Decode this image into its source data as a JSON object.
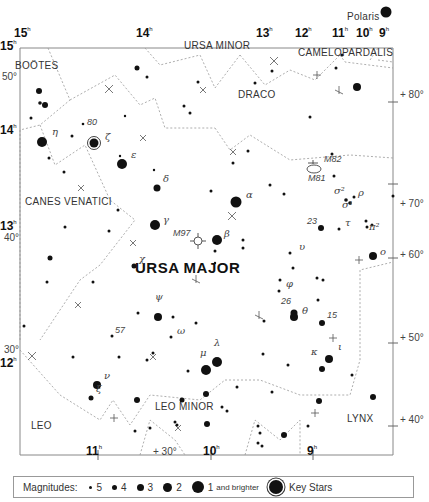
{
  "chart": {
    "title": "URSA MAJOR",
    "ra_labels": [
      {
        "text": "15",
        "sup": "h",
        "x": 14,
        "y": 37
      },
      {
        "text": "14",
        "sup": "h",
        "x": 136,
        "y": 37
      },
      {
        "text": "13",
        "sup": "h",
        "x": 256,
        "y": 37
      },
      {
        "text": "12",
        "sup": "h",
        "x": 295,
        "y": 37
      },
      {
        "text": "11",
        "sup": "h",
        "x": 332,
        "y": 37
      },
      {
        "text": "10",
        "sup": "h",
        "x": 356,
        "y": 37
      },
      {
        "text": "9",
        "sup": "h",
        "x": 379,
        "y": 37
      },
      {
        "text": "15",
        "sup": "h",
        "x": 0,
        "y": 50
      },
      {
        "text": "14",
        "sup": "h",
        "x": 0,
        "y": 134
      },
      {
        "text": "13",
        "sup": "h",
        "x": 0,
        "y": 230
      },
      {
        "text": "12",
        "sup": "h",
        "x": 0,
        "y": 367
      },
      {
        "text": "11",
        "sup": "h",
        "x": 86,
        "y": 455
      },
      {
        "text": "10",
        "sup": "h",
        "x": 203,
        "y": 455
      },
      {
        "text": "9",
        "sup": "h",
        "x": 307,
        "y": 455
      }
    ],
    "dec_labels": [
      {
        "text": "50°",
        "x": 2,
        "y": 80
      },
      {
        "text": "40°",
        "x": 4,
        "y": 241
      },
      {
        "text": "30°",
        "x": 4,
        "y": 353
      },
      {
        "text": "+ 80°",
        "x": 400,
        "y": 98
      },
      {
        "text": "+ 70°",
        "x": 400,
        "y": 207
      },
      {
        "text": "+ 60°",
        "x": 400,
        "y": 258
      },
      {
        "text": "+ 50°",
        "x": 400,
        "y": 341
      },
      {
        "text": "+ 40°",
        "x": 400,
        "y": 423
      },
      {
        "text": "+ 30°",
        "x": 153,
        "y": 455
      }
    ],
    "constellations": [
      {
        "name": "BOÖTES",
        "x": 15,
        "y": 69
      },
      {
        "name": "URSA MINOR",
        "x": 184,
        "y": 49
      },
      {
        "name": "CAMELOPARDALIS",
        "x": 298,
        "y": 56
      },
      {
        "name": "DRACO",
        "x": 238,
        "y": 98
      },
      {
        "name": "CANES VENATICI",
        "x": 25,
        "y": 205
      },
      {
        "name": "LEO MINOR",
        "x": 155,
        "y": 410
      },
      {
        "name": "LEO",
        "x": 31,
        "y": 429
      },
      {
        "name": "LYNX",
        "x": 347,
        "y": 422
      }
    ],
    "star_labels": [
      {
        "text": "Polaris",
        "x": 347,
        "y": 20,
        "cls": "const"
      },
      {
        "text": "η",
        "x": 52,
        "y": 135,
        "cls": "greek"
      },
      {
        "text": "80",
        "x": 87,
        "y": 126,
        "cls": "num"
      },
      {
        "text": "ζ",
        "x": 105,
        "y": 140,
        "cls": "greek"
      },
      {
        "text": "ε",
        "x": 131,
        "y": 158,
        "cls": "greek"
      },
      {
        "text": "δ",
        "x": 163,
        "y": 182,
        "cls": "greek"
      },
      {
        "text": "α",
        "x": 246,
        "y": 198,
        "cls": "greek"
      },
      {
        "text": "γ",
        "x": 163,
        "y": 223,
        "cls": "greek"
      },
      {
        "text": "M97",
        "x": 173,
        "y": 237,
        "cls": "num"
      },
      {
        "text": "β",
        "x": 224,
        "y": 237,
        "cls": "greek"
      },
      {
        "text": "χ",
        "x": 139,
        "y": 262,
        "cls": "greek"
      },
      {
        "text": "ψ",
        "x": 155,
        "y": 300,
        "cls": "greek"
      },
      {
        "text": "57",
        "x": 115,
        "y": 334,
        "cls": "num"
      },
      {
        "text": "ω",
        "x": 177,
        "y": 334,
        "cls": "greek"
      },
      {
        "text": "μ",
        "x": 200,
        "y": 356,
        "cls": "greek"
      },
      {
        "text": "λ",
        "x": 214,
        "y": 346,
        "cls": "greek"
      },
      {
        "text": "ν",
        "x": 104,
        "y": 379,
        "cls": "greek"
      },
      {
        "text": "ξ",
        "x": 96,
        "y": 392,
        "cls": "greek"
      },
      {
        "text": "M82",
        "x": 324,
        "y": 163,
        "cls": "num"
      },
      {
        "text": "M81",
        "x": 308,
        "y": 182,
        "cls": "num"
      },
      {
        "text": "σ²",
        "x": 334,
        "y": 194,
        "cls": "greek"
      },
      {
        "text": "ρ",
        "x": 358,
        "y": 196,
        "cls": "greek"
      },
      {
        "text": "σ¹",
        "x": 342,
        "y": 208,
        "cls": "greek"
      },
      {
        "text": "23",
        "x": 307,
        "y": 225,
        "cls": "num"
      },
      {
        "text": "τ",
        "x": 345,
        "y": 226,
        "cls": "greek"
      },
      {
        "text": "π²",
        "x": 369,
        "y": 230,
        "cls": "greek"
      },
      {
        "text": "υ",
        "x": 299,
        "y": 250,
        "cls": "greek"
      },
      {
        "text": "ο",
        "x": 380,
        "y": 255,
        "cls": "greek"
      },
      {
        "text": "φ",
        "x": 286,
        "y": 287,
        "cls": "greek"
      },
      {
        "text": "26",
        "x": 281,
        "y": 305,
        "cls": "num"
      },
      {
        "text": "θ",
        "x": 302,
        "y": 314,
        "cls": "greek"
      },
      {
        "text": "15",
        "x": 327,
        "y": 319,
        "cls": "num"
      },
      {
        "text": "ι",
        "x": 338,
        "y": 350,
        "cls": "greek"
      },
      {
        "text": "κ",
        "x": 311,
        "y": 355,
        "cls": "greek"
      }
    ]
  },
  "legend": {
    "title": "Magnitudes:",
    "items": [
      {
        "label": "5",
        "size": 3
      },
      {
        "label": "4",
        "size": 5
      },
      {
        "label": "3",
        "size": 7
      },
      {
        "label": "2",
        "size": 9
      },
      {
        "label": "1",
        "suffix": "and brighter",
        "size": 12
      }
    ],
    "key_label": "Key Stars"
  }
}
